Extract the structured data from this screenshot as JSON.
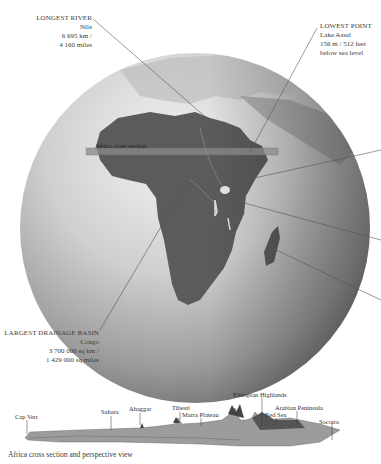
{
  "map": {
    "region": "Africa",
    "globe_colors": {
      "ocean_light": "#e6e6e6",
      "ocean_dark": "#7a7a7a",
      "land": "#5e5e5e",
      "cross_section_band": "#8a8a8a"
    },
    "cross_section_label": "Africa cross section"
  },
  "callouts": {
    "longest_river": {
      "title": "LONGEST RIVER",
      "name": "Nile",
      "line1": "6 695 km /",
      "line2": "4 160 miles"
    },
    "lowest_point": {
      "title": "LOWEST POINT",
      "name": "Lake Assal",
      "line1": "156 m / 512 feet",
      "line2": "below sea level"
    },
    "largest_basin": {
      "title": "LARGEST DRAINAGE BASIN",
      "name": "Congo",
      "line1": "3 700 000 sq km /",
      "line2": "1 429 000 sq miles"
    }
  },
  "profile": {
    "labels": [
      "Cap Vert",
      "Sahara",
      "Ahaggar",
      "Tibesti",
      "Marra Plateau",
      "Ethiopian Highlands",
      "Red Sea",
      "Arabian Peninsula",
      "Socotra"
    ],
    "caption": "Africa cross section and perspective view"
  }
}
